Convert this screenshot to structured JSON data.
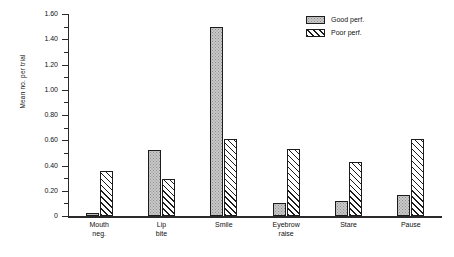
{
  "chart_data": {
    "type": "bar",
    "title": "",
    "xlabel": "",
    "ylabel": "Mean no. per trial",
    "ylim": [
      0,
      1.6
    ],
    "ytick_step": 0.2,
    "ytick_labels": [
      "0",
      "0.20",
      "0.40",
      "0.60",
      "0.80",
      "1.00",
      "1.20",
      "1.40",
      "1.60"
    ],
    "ytick_values": [
      0,
      0.2,
      0.4,
      0.6,
      0.8,
      1.0,
      1.2,
      1.4,
      1.6
    ],
    "minor_ticks": true,
    "grid": false,
    "legend_position": "top-right",
    "categories": [
      "Mouth\nneg.",
      "Lip\nbite",
      "Smile",
      "Eyebrow\nraise",
      "Stare",
      "Pause"
    ],
    "category_labels_flat": [
      "Mouth neg.",
      "Lip bite",
      "Smile",
      "Eyebrow raise",
      "Stare",
      "Pause"
    ],
    "series": [
      {
        "name": "Good perf.",
        "fill": "stipple",
        "values": [
          0.02,
          0.52,
          1.5,
          0.1,
          0.12,
          0.17
        ]
      },
      {
        "name": "Poor perf.",
        "fill": "diagonal-hatch",
        "values": [
          0.36,
          0.29,
          0.61,
          0.53,
          0.43,
          0.61
        ]
      }
    ]
  },
  "legend": {
    "items": [
      {
        "label": "Good perf.",
        "swatch": "stipple-swatch"
      },
      {
        "label": "Poor perf.",
        "swatch": "hatch-swatch"
      }
    ]
  },
  "colors": {
    "axis": "#2a2a2a",
    "text": "#111111",
    "good_fill": "#c9c9c9",
    "poor_fill": "#ffffff",
    "bar_outline": "#1c1c1c",
    "background": "#ffffff"
  }
}
